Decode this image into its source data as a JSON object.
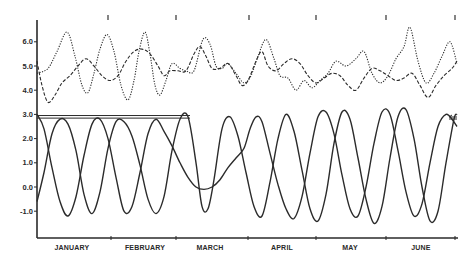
{
  "chart_data": {
    "type": "line",
    "title": "",
    "xlabel": "",
    "ylabel": "",
    "ylim": [
      -1.8,
      6.8
    ],
    "grid": false,
    "legend": null,
    "y_ticks": [
      "6.0",
      "5.0",
      "4.0",
      "3.0",
      "2.0",
      "1.0",
      "0.0",
      "-1.0"
    ],
    "y_tick_values": [
      6.0,
      5.0,
      4.0,
      3.0,
      2.0,
      1.0,
      0.0,
      -1.0
    ],
    "categories": [
      "JANUARY",
      "FEBRUARY",
      "MARCH",
      "APRIL",
      "MAY",
      "JUNE"
    ],
    "x_domain_px": [
      37,
      457
    ],
    "series": [
      {
        "name": "upper-dotted",
        "style": "dotted",
        "points": [
          [
            37,
            4.7
          ],
          [
            48,
            4.9
          ],
          [
            57,
            5.6
          ],
          [
            67,
            6.4
          ],
          [
            75,
            5.4
          ],
          [
            82,
            4.2
          ],
          [
            88,
            3.9
          ],
          [
            94,
            4.7
          ],
          [
            100,
            5.7
          ],
          [
            107,
            6.3
          ],
          [
            114,
            5.6
          ],
          [
            121,
            4.2
          ],
          [
            128,
            3.6
          ],
          [
            134,
            4.4
          ],
          [
            139,
            5.6
          ],
          [
            145,
            6.4
          ],
          [
            150,
            5.5
          ],
          [
            155,
            4.2
          ],
          [
            160,
            3.8
          ],
          [
            166,
            4.4
          ],
          [
            172,
            5.1
          ],
          [
            180,
            4.9
          ],
          [
            186,
            4.8
          ],
          [
            194,
            4.8
          ],
          [
            203,
            6.1
          ],
          [
            210,
            5.9
          ],
          [
            216,
            5.0
          ],
          [
            222,
            4.9
          ],
          [
            228,
            5.1
          ],
          [
            236,
            4.7
          ],
          [
            244,
            4.3
          ],
          [
            251,
            4.6
          ],
          [
            258,
            5.4
          ],
          [
            266,
            6.1
          ],
          [
            274,
            5.3
          ],
          [
            280,
            4.6
          ],
          [
            288,
            4.5
          ],
          [
            296,
            4.0
          ],
          [
            304,
            4.4
          ],
          [
            312,
            4.1
          ],
          [
            320,
            4.4
          ],
          [
            328,
            4.7
          ],
          [
            336,
            5.2
          ],
          [
            346,
            5.0
          ],
          [
            356,
            5.3
          ],
          [
            364,
            5.6
          ],
          [
            372,
            4.7
          ],
          [
            380,
            4.3
          ],
          [
            388,
            4.6
          ],
          [
            396,
            5.3
          ],
          [
            404,
            5.8
          ],
          [
            410,
            6.6
          ],
          [
            418,
            5.2
          ],
          [
            426,
            4.3
          ],
          [
            434,
            4.7
          ],
          [
            442,
            5.4
          ],
          [
            450,
            6.0
          ],
          [
            457,
            5.1
          ]
        ]
      },
      {
        "name": "upper-dashed",
        "style": "dashed",
        "points": [
          [
            37,
            5.2
          ],
          [
            42,
            4.2
          ],
          [
            48,
            3.5
          ],
          [
            55,
            3.8
          ],
          [
            62,
            4.3
          ],
          [
            70,
            4.6
          ],
          [
            78,
            5.0
          ],
          [
            86,
            5.3
          ],
          [
            94,
            5.0
          ],
          [
            102,
            4.6
          ],
          [
            110,
            4.4
          ],
          [
            118,
            4.6
          ],
          [
            126,
            5.2
          ],
          [
            134,
            5.6
          ],
          [
            142,
            5.7
          ],
          [
            150,
            5.5
          ],
          [
            158,
            5.0
          ],
          [
            164,
            4.6
          ],
          [
            170,
            4.8
          ],
          [
            178,
            4.8
          ],
          [
            186,
            4.8
          ],
          [
            194,
            5.5
          ],
          [
            200,
            5.8
          ],
          [
            206,
            5.4
          ],
          [
            212,
            4.9
          ],
          [
            220,
            4.9
          ],
          [
            228,
            5.1
          ],
          [
            236,
            4.6
          ],
          [
            242,
            4.2
          ],
          [
            248,
            4.4
          ],
          [
            256,
            5.2
          ],
          [
            262,
            5.6
          ],
          [
            268,
            5.0
          ],
          [
            276,
            4.8
          ],
          [
            284,
            5.1
          ],
          [
            292,
            5.3
          ],
          [
            300,
            5.1
          ],
          [
            308,
            4.6
          ],
          [
            316,
            4.3
          ],
          [
            324,
            4.5
          ],
          [
            332,
            4.7
          ],
          [
            340,
            4.6
          ],
          [
            348,
            4.2
          ],
          [
            356,
            4.0
          ],
          [
            364,
            4.5
          ],
          [
            372,
            4.9
          ],
          [
            380,
            4.8
          ],
          [
            388,
            4.6
          ],
          [
            396,
            4.4
          ],
          [
            404,
            4.5
          ],
          [
            412,
            4.7
          ],
          [
            420,
            4.2
          ],
          [
            428,
            3.7
          ],
          [
            436,
            4.2
          ],
          [
            444,
            4.6
          ],
          [
            452,
            4.9
          ],
          [
            457,
            5.2
          ]
        ]
      },
      {
        "name": "lower-solid-a",
        "style": "solid",
        "points": [
          [
            37,
            -0.6
          ],
          [
            44,
            0.6
          ],
          [
            52,
            2.2
          ],
          [
            60,
            2.8
          ],
          [
            68,
            2.6
          ],
          [
            76,
            1.5
          ],
          [
            84,
            -0.3
          ],
          [
            92,
            -1.1
          ],
          [
            100,
            -0.2
          ],
          [
            108,
            1.6
          ],
          [
            116,
            2.7
          ],
          [
            124,
            2.7
          ],
          [
            132,
            2.1
          ],
          [
            140,
            0.9
          ],
          [
            148,
            -0.5
          ],
          [
            156,
            -1.1
          ],
          [
            164,
            -0.4
          ],
          [
            172,
            1.5
          ],
          [
            180,
            2.8
          ],
          [
            188,
            2.9
          ],
          [
            196,
            1.0
          ],
          [
            202,
            -0.8
          ],
          [
            208,
            -0.9
          ],
          [
            214,
            0.3
          ],
          [
            222,
            2.4
          ],
          [
            230,
            2.9
          ],
          [
            238,
            2.1
          ],
          [
            246,
            0.6
          ],
          [
            254,
            -0.8
          ],
          [
            262,
            -1.2
          ],
          [
            270,
            0.2
          ],
          [
            278,
            2.0
          ],
          [
            286,
            3.0
          ],
          [
            294,
            2.3
          ],
          [
            302,
            0.7
          ],
          [
            310,
            -0.9
          ],
          [
            318,
            -1.4
          ],
          [
            326,
            -0.3
          ],
          [
            334,
            1.8
          ],
          [
            342,
            3.1
          ],
          [
            350,
            2.8
          ],
          [
            358,
            1.2
          ],
          [
            366,
            -0.5
          ],
          [
            374,
            -1.5
          ],
          [
            382,
            -0.8
          ],
          [
            390,
            1.2
          ],
          [
            398,
            2.9
          ],
          [
            406,
            3.2
          ],
          [
            414,
            2.0
          ],
          [
            422,
            0.0
          ],
          [
            430,
            -1.4
          ],
          [
            438,
            -1.0
          ],
          [
            446,
            1.0
          ],
          [
            454,
            2.8
          ],
          [
            457,
            3.0
          ]
        ]
      },
      {
        "name": "lower-solid-b",
        "style": "solid",
        "points": [
          [
            37,
            3.0
          ],
          [
            44,
            2.4
          ],
          [
            52,
            0.8
          ],
          [
            60,
            -0.6
          ],
          [
            68,
            -1.2
          ],
          [
            76,
            -0.4
          ],
          [
            84,
            1.3
          ],
          [
            92,
            2.6
          ],
          [
            100,
            2.8
          ],
          [
            108,
            2.0
          ],
          [
            116,
            0.4
          ],
          [
            124,
            -1.0
          ],
          [
            132,
            -0.8
          ],
          [
            140,
            0.6
          ],
          [
            148,
            2.2
          ],
          [
            156,
            2.8
          ],
          [
            164,
            2.3
          ],
          [
            172,
            1.7
          ],
          [
            180,
            1.0
          ],
          [
            188,
            0.4
          ],
          [
            196,
            0.0
          ],
          [
            204,
            -0.1
          ],
          [
            212,
            0.0
          ],
          [
            220,
            0.3
          ],
          [
            228,
            0.8
          ],
          [
            236,
            1.2
          ],
          [
            244,
            1.6
          ],
          [
            250,
            2.4
          ],
          [
            256,
            2.9
          ],
          [
            262,
            2.7
          ],
          [
            270,
            1.4
          ],
          [
            278,
            0.1
          ],
          [
            286,
            -0.9
          ],
          [
            294,
            -1.3
          ],
          [
            302,
            -0.4
          ],
          [
            310,
            1.4
          ],
          [
            318,
            2.9
          ],
          [
            326,
            3.1
          ],
          [
            334,
            2.2
          ],
          [
            342,
            0.5
          ],
          [
            350,
            -0.9
          ],
          [
            358,
            -1.2
          ],
          [
            366,
            0.0
          ],
          [
            374,
            1.8
          ],
          [
            382,
            3.1
          ],
          [
            390,
            3.0
          ],
          [
            398,
            1.5
          ],
          [
            406,
            -0.2
          ],
          [
            414,
            -1.2
          ],
          [
            422,
            -0.7
          ],
          [
            430,
            1.0
          ],
          [
            438,
            2.5
          ],
          [
            446,
            3.0
          ],
          [
            452,
            2.8
          ],
          [
            457,
            2.5
          ]
        ]
      },
      {
        "name": "baseline-horizontal",
        "style": "double-solid",
        "points": [
          [
            37,
            2.9
          ],
          [
            190,
            2.9
          ]
        ]
      }
    ]
  },
  "axes": {
    "y_labels": [
      "6.0",
      "5.0",
      "4.0",
      "3.0",
      "2.0",
      "1.0",
      "0.0",
      "-1.0"
    ],
    "x_labels": [
      "JANUARY",
      "FEBRUARY",
      "MARCH",
      "APRIL",
      "MAY",
      "JUNE"
    ]
  }
}
